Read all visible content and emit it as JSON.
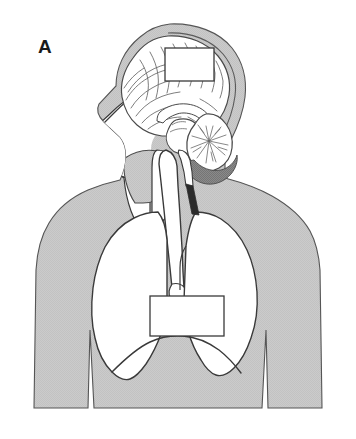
{
  "figure": {
    "panel_label": "A",
    "alt_summary": "Sagittal anatomical illustration of the human head, neck and thorax showing the brain, airway, trachea and lungs, with two blank white label boxes overlaid on the cerebrum and on the mediastinum/heart region.",
    "background_color": "#ffffff",
    "body_fill_color": "#c9c9c9",
    "body_stroke_color": "#3a3a3a",
    "cavity_fill_color": "#ffffff",
    "brain_stroke_color": "#4a4a4a",
    "shadow_fill_color": "#7d7d7d",
    "label_box_fill": "#ffffff",
    "label_box_stroke": "#3a3a3a"
  },
  "label_boxes": [
    {
      "name": "brain-label-box",
      "text": "",
      "x": 165,
      "y": 48,
      "width": 49,
      "height": 33,
      "region": "cerebrum"
    },
    {
      "name": "thorax-label-box",
      "text": "",
      "x": 150,
      "y": 296,
      "width": 74,
      "height": 40,
      "region": "mediastinum"
    }
  ],
  "anatomy_parts": [
    {
      "name": "body-silhouette",
      "label": "Head, neck and thorax outline"
    },
    {
      "name": "scalp-and-skull",
      "label": "Scalp and skull"
    },
    {
      "name": "cerebrum",
      "label": "Cerebrum with gyri and sulci"
    },
    {
      "name": "corpus-callosum",
      "label": "Corpus callosum"
    },
    {
      "name": "cerebellum",
      "label": "Cerebellum with arbor vitae"
    },
    {
      "name": "brainstem",
      "label": "Brainstem"
    },
    {
      "name": "spinal-cord",
      "label": "Spinal cord"
    },
    {
      "name": "facial-profile",
      "label": "Facial profile with nose and lips"
    },
    {
      "name": "nasal-oral-cavity",
      "label": "Nasal and oral cavity airway"
    },
    {
      "name": "pharynx",
      "label": "Pharynx"
    },
    {
      "name": "trachea",
      "label": "Trachea"
    },
    {
      "name": "lung-left",
      "label": "Left lung"
    },
    {
      "name": "lung-right",
      "label": "Right lung"
    },
    {
      "name": "diaphragm",
      "label": "Diaphragm"
    }
  ]
}
